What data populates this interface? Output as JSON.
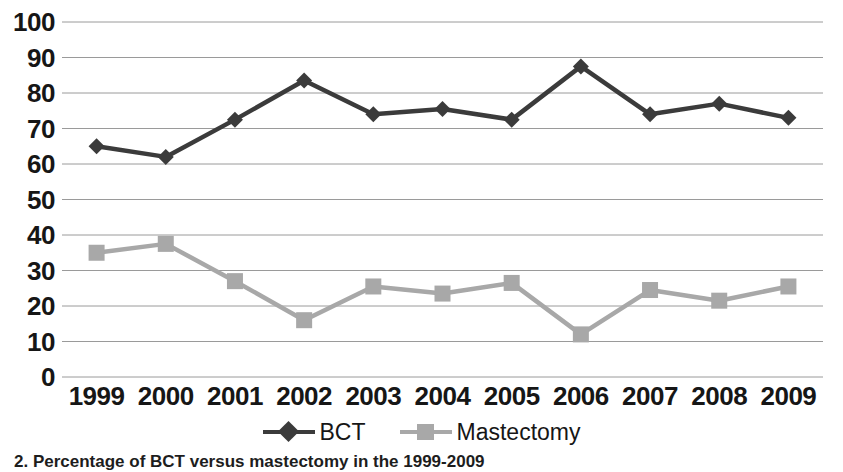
{
  "chart_data": {
    "type": "line",
    "title": "",
    "subtitle": "",
    "xlabel": "",
    "ylabel": "",
    "categories": [
      "1999",
      "2000",
      "2001",
      "2002",
      "2003",
      "2004",
      "2005",
      "2006",
      "2007",
      "2008",
      "2009"
    ],
    "series": [
      {
        "name": "BCT",
        "color": "#3b3b3b",
        "marker": "diamond",
        "values": [
          65,
          62,
          72.5,
          83.5,
          74,
          75.5,
          72.5,
          87.5,
          74,
          77,
          73
        ]
      },
      {
        "name": "Mastectomy",
        "color": "#a8a8a8",
        "marker": "square",
        "values": [
          35,
          37.5,
          27,
          16,
          25.5,
          23.5,
          26.5,
          12,
          24.5,
          21.5,
          25.5
        ]
      }
    ],
    "ylim": [
      0,
      100
    ],
    "ytick_labels": [
      "100",
      "90",
      "80",
      "70",
      "60",
      "50",
      "40",
      "30",
      "20",
      "10",
      "0"
    ],
    "ytick_values": [
      100,
      90,
      80,
      70,
      60,
      50,
      40,
      30,
      20,
      10,
      0
    ],
    "grid": true,
    "grid_axis": "y",
    "grid_color": "#9a9a9a",
    "legend_position": "bottom",
    "legend_entries": [
      "BCT",
      "Mastectomy"
    ]
  },
  "legend": {
    "items": [
      {
        "label": "BCT"
      },
      {
        "label": "Mastectomy"
      }
    ]
  },
  "caption": {
    "text": "2. Percentage of BCT versus mastectomy in the 1999-2009"
  },
  "colors": {
    "bct": "#3b3b3b",
    "mastectomy": "#a8a8a8",
    "grid": "#9a9a9a",
    "text": "#161616",
    "background": "#ffffff"
  }
}
